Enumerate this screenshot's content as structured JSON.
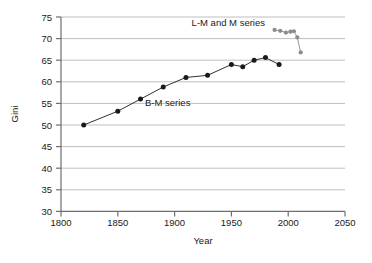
{
  "chart_data": {
    "type": "line",
    "title": "",
    "xlabel": "Year",
    "ylabel": "Gini",
    "xlim": [
      1800,
      2050
    ],
    "ylim": [
      30,
      75
    ],
    "xticks": [
      1800,
      1850,
      1900,
      1950,
      2000,
      2050
    ],
    "yticks": [
      30,
      35,
      40,
      45,
      50,
      55,
      60,
      65,
      70,
      75
    ],
    "grid": "horizontal",
    "legend_position": "inline-annotations",
    "series": [
      {
        "name": "B-M series",
        "color": "#1a1a1a",
        "marker": "circle",
        "x": [
          1820,
          1850,
          1870,
          1890,
          1910,
          1929,
          1950,
          1960,
          1970,
          1980,
          1992
        ],
        "values": [
          50.0,
          53.2,
          56.0,
          58.8,
          61.0,
          61.5,
          64.0,
          63.5,
          65.0,
          65.6,
          64.0
        ]
      },
      {
        "name": "L-M and M series",
        "color": "#8c8c8c",
        "marker": "circle",
        "x": [
          1988,
          1993,
          1998,
          2002,
          2005,
          2008,
          2011
        ],
        "values": [
          72.0,
          71.8,
          71.4,
          71.6,
          71.7,
          70.3,
          66.8
        ]
      }
    ],
    "annotations": [
      {
        "text": "L-M and M series",
        "x": 1935,
        "y": 72.2
      },
      {
        "text": "B-M series",
        "x": 1888,
        "y": 56.0
      }
    ]
  },
  "axes": {
    "y_title": "Gini",
    "x_title": "Year",
    "y_tick_labels": [
      "75",
      "70",
      "65",
      "60",
      "55",
      "50",
      "45",
      "40",
      "35",
      "30"
    ],
    "x_tick_labels": [
      "1800",
      "1850",
      "1900",
      "1950",
      "2000",
      "2050"
    ]
  },
  "labels": {
    "lm_series": "L-M and M series",
    "bm_series": "B-M series"
  },
  "colors": {
    "bm_series": "#1a1a1a",
    "lm_series": "#8c8c8c",
    "gridline": "#bfbfbf",
    "axis": "#6e6e6e",
    "background": "#ffffff"
  }
}
